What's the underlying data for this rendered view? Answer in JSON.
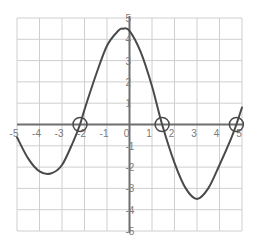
{
  "chart_data": {
    "type": "line",
    "title": "",
    "xlabel": "",
    "ylabel": "",
    "xlim": [
      -5,
      5
    ],
    "ylim": [
      -5,
      5
    ],
    "grid": true,
    "x_ticks": [
      -5,
      -4,
      -3,
      -2,
      -1,
      0,
      1,
      2,
      3,
      4,
      5
    ],
    "y_ticks": [
      -5,
      -4,
      -3,
      -2,
      -1,
      0,
      1,
      2,
      3,
      4,
      5
    ],
    "x_tick_labels": [
      "-5",
      "-4",
      "-3",
      "-2",
      "-1",
      "0",
      "1",
      "2",
      "3",
      "4",
      "5"
    ],
    "y_tick_labels": [
      "-5",
      "-4",
      "-3",
      "-2",
      "-1",
      "0",
      "1",
      "2",
      "3",
      "4",
      "5"
    ],
    "series": [
      {
        "name": "polynomial curve",
        "x": [
          -5,
          -4.5,
          -4,
          -3.5,
          -3,
          -2.5,
          -2.2,
          -2,
          -1.5,
          -1,
          -0.5,
          -0.3,
          0,
          0.5,
          1,
          1.45,
          2,
          2.5,
          3,
          3.5,
          4,
          4.5,
          4.75,
          5
        ],
        "values": [
          -0.6,
          -1.6,
          -2.2,
          -2.3,
          -1.9,
          -0.8,
          0,
          0.7,
          2.3,
          3.7,
          4.4,
          4.5,
          4.4,
          3.4,
          1.8,
          0,
          -1.8,
          -3.0,
          -3.5,
          -3.0,
          -1.9,
          -0.7,
          0,
          0.8
        ]
      }
    ],
    "annotations": [
      {
        "type": "circle",
        "label": "root",
        "x": -2.2,
        "y": 0
      },
      {
        "type": "circle",
        "label": "root",
        "x": 1.45,
        "y": 0
      },
      {
        "type": "circle",
        "label": "root",
        "x": 4.75,
        "y": 0
      }
    ],
    "style": {
      "curve_color": "#4a4a4a",
      "axis_color": "#6e6e6e",
      "grid_color": "#cfcfcf",
      "tick_color": "#7a7a7a"
    }
  }
}
